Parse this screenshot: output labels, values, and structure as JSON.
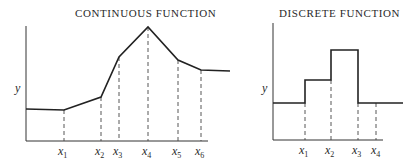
{
  "left_panel": {
    "title": "CONTINUOUS FUNCTION",
    "y_label": "y",
    "x_ticks": [
      {
        "base": "x",
        "sub": "1"
      },
      {
        "base": "x",
        "sub": "2"
      },
      {
        "base": "x",
        "sub": "3"
      },
      {
        "base": "x",
        "sub": "4"
      },
      {
        "base": "x",
        "sub": "5"
      },
      {
        "base": "x",
        "sub": "6"
      }
    ]
  },
  "right_panel": {
    "title": "DISCRETE FUNCTION",
    "y_label": "y",
    "x_ticks": [
      {
        "base": "x",
        "sub": "1"
      },
      {
        "base": "x",
        "sub": "2"
      },
      {
        "base": "x",
        "sub": "3"
      },
      {
        "base": "x",
        "sub": "4"
      }
    ]
  },
  "colors": {
    "line": "#222222",
    "background": "#ffffff"
  }
}
